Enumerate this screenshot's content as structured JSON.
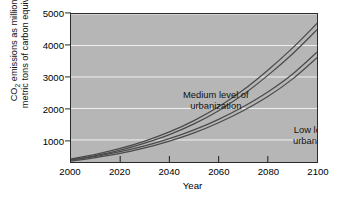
{
  "chart_data": {
    "type": "line",
    "title": "",
    "subtitle": "",
    "xlabel": "Year",
    "ylabel_line1": "CO",
    "ylabel_sub": "2",
    "ylabel_line1_rest": " emissions as millions of",
    "ylabel_line2": "metric tons of carbon equivalent",
    "ylabel_full": "CO2 emissions as millions of metric tons of carbon equivalent",
    "xlim": [
      2000,
      2100
    ],
    "ylim": [
      300,
      5000
    ],
    "xticks": [
      "2000",
      "2020",
      "2040",
      "2060",
      "2080",
      "2100"
    ],
    "xtick_values": [
      2000,
      2020,
      2040,
      2060,
      2080,
      2100
    ],
    "yticks": [
      "1000",
      "2000",
      "3000",
      "4000",
      "5000"
    ],
    "ytick_values": [
      1000,
      2000,
      3000,
      4000,
      5000
    ],
    "grid": "horizontal",
    "grid_color": "#f2f2f2",
    "plot_background": "#b6b6b6",
    "legend": "annotations-inline",
    "x": [
      2000,
      2010,
      2020,
      2030,
      2040,
      2050,
      2060,
      2070,
      2080,
      2090,
      2100
    ],
    "series": [
      {
        "name": "Medium level of urbanization",
        "color": "#4a4a4a",
        "band": true,
        "values": [
          380,
          520,
          700,
          930,
          1210,
          1560,
          1990,
          2510,
          3130,
          3820,
          4600
        ],
        "values_upper": [
          400,
          545,
          730,
          965,
          1255,
          1615,
          2055,
          2585,
          3215,
          3915,
          4700
        ],
        "values_lower": [
          360,
          500,
          675,
          900,
          1170,
          1510,
          1930,
          2440,
          3050,
          3730,
          4500
        ]
      },
      {
        "name": "Low level of urbanization",
        "color": "#4a4a4a",
        "band": true,
        "values": [
          350,
          460,
          600,
          780,
          1000,
          1270,
          1600,
          1990,
          2450,
          3010,
          3700
        ],
        "values_upper": [
          368,
          482,
          628,
          812,
          1040,
          1318,
          1655,
          2055,
          2525,
          3090,
          3790
        ],
        "values_lower": [
          333,
          440,
          574,
          750,
          962,
          1225,
          1548,
          1928,
          2378,
          2932,
          3612
        ]
      }
    ],
    "annotations": [
      {
        "text_line1": "Medium level of",
        "text_line2": "urbanization"
      },
      {
        "text_line1": "Low level of",
        "text_line2": "urbanization"
      }
    ]
  }
}
